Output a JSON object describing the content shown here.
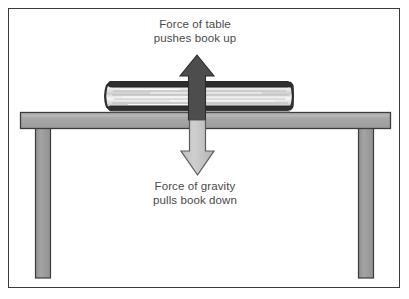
{
  "diagram": {
    "border_color": "#3a3a3a",
    "background": "#ffffff",
    "captions": {
      "top": {
        "line1": "Force of table",
        "line2": "pushes book up"
      },
      "bottom": {
        "line1": "Force of gravity",
        "line2": "pulls book down"
      }
    },
    "arrows": {
      "normal_force": {
        "label": "Force of table pushes book up",
        "direction": "up",
        "fill": "#4d4d4d",
        "stroke": "#2b2b2b"
      },
      "gravity_force": {
        "label": "Force of gravity pulls book down",
        "direction": "down",
        "fill": "#c8c8c8",
        "stroke": "#5a5a5a"
      }
    },
    "objects": {
      "book": {
        "name": "book",
        "cover_color": "#2e2e2e",
        "pages_color": "#ececec"
      },
      "table": {
        "name": "table",
        "top_color": "#a8a8a8",
        "leg_color": "#9a9a9a",
        "outline_color": "#3c3c3c"
      }
    },
    "text_color": "#4a4a4a"
  }
}
